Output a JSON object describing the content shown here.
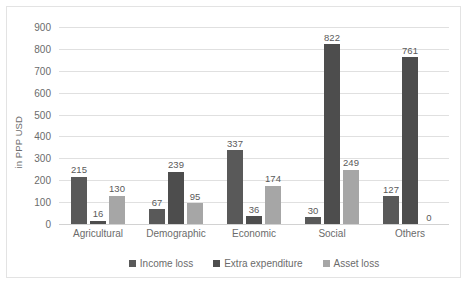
{
  "chart_data": {
    "type": "bar",
    "title": "",
    "subtitle": "",
    "xlabel": "",
    "ylabel": "in PPP USD",
    "ylim": [
      0,
      900
    ],
    "ytick_step": 100,
    "yticks": [
      "0",
      "100",
      "200",
      "300",
      "400",
      "500",
      "600",
      "700",
      "800",
      "900"
    ],
    "grid": "horizontal",
    "legend_position": "bottom",
    "categories": [
      "Agricultural",
      "Demographic",
      "Economic",
      "Social",
      "Others"
    ],
    "series": [
      {
        "name": "Income loss",
        "color": "#595959",
        "values": [
          215,
          67,
          337,
          30,
          127
        ]
      },
      {
        "name": "Extra expenditure",
        "color": "#4d4d4d",
        "values": [
          16,
          239,
          36,
          822,
          761
        ]
      },
      {
        "name": "Asset loss",
        "color": "#a6a6a6",
        "values": [
          130,
          95,
          174,
          249,
          0
        ]
      }
    ],
    "data_labels": [
      [
        "215",
        "16",
        "130"
      ],
      [
        "67",
        "239",
        "95"
      ],
      [
        "337",
        "36",
        "174"
      ],
      [
        "30",
        "822",
        "249"
      ],
      [
        "127",
        "761",
        "0"
      ]
    ]
  },
  "colors": {
    "frame_border": "#e3e3e3",
    "gridline": "#e0e0e0",
    "axis_text": "#6b6b6b",
    "label_text": "#5a5a5a",
    "background": "#ffffff"
  }
}
